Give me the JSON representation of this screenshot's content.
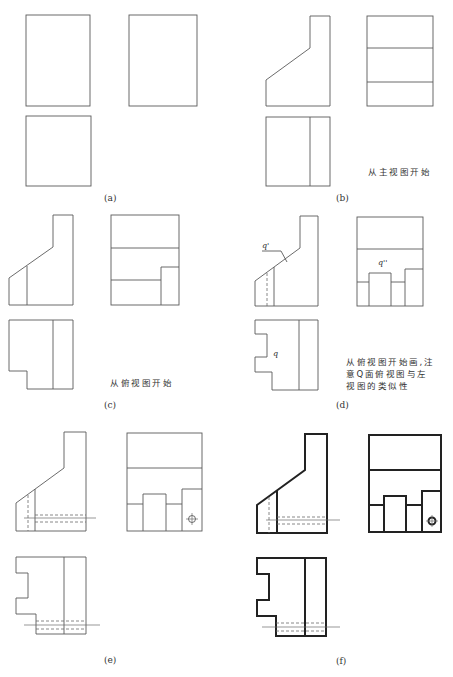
{
  "panels": [
    {
      "id": "a",
      "label": "(a)"
    },
    {
      "id": "b",
      "label": "(b)",
      "note": [
        "从主视图开始"
      ]
    },
    {
      "id": "c",
      "label": "(c)",
      "note": [
        "从俯视图开始"
      ]
    },
    {
      "id": "d",
      "label": "(d)",
      "note": [
        "从俯视图开始画,注",
        "意Q面俯视图与左",
        "视图的类似性"
      ],
      "symbols": {
        "front": "q'",
        "side": "q''",
        "top": "q"
      }
    },
    {
      "id": "e",
      "label": "(e)"
    },
    {
      "id": "f",
      "label": "(f)"
    }
  ],
  "colors": {
    "line": "#5a5a5a",
    "thick": "#222222",
    "background": "#ffffff"
  }
}
